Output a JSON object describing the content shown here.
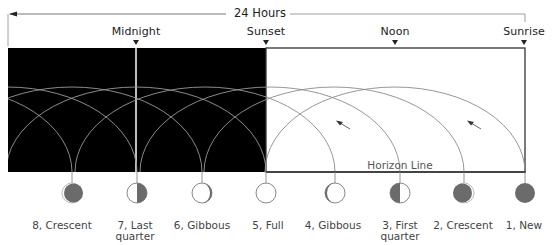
{
  "header": {
    "span_label": "24 Hours"
  },
  "time_markers": [
    {
      "label": "Midnight",
      "x": 136
    },
    {
      "label": "Sunset",
      "x": 266
    },
    {
      "label": "Noon",
      "x": 395
    },
    {
      "label": "Sunrise",
      "x": 524
    }
  ],
  "horizon": {
    "label": "Horizon Line"
  },
  "phases": [
    {
      "number": "8",
      "line1": "8, Crescent",
      "line2": "",
      "x": 72,
      "shape": "waning-crescent"
    },
    {
      "number": "7",
      "line1": "7, Last",
      "line2": "quarter",
      "x": 137,
      "shape": "last-quarter"
    },
    {
      "number": "6",
      "line1": "6, Gibbous",
      "line2": "",
      "x": 202,
      "shape": "waning-gibbous"
    },
    {
      "number": "5",
      "line1": "5, Full",
      "line2": "",
      "x": 266,
      "shape": "full"
    },
    {
      "number": "4",
      "line1": "4, Gibbous",
      "line2": "",
      "x": 335,
      "shape": "waxing-gibbous"
    },
    {
      "number": "3",
      "line1": "3, First",
      "line2": "quarter",
      "x": 400,
      "shape": "first-quarter"
    },
    {
      "number": "2",
      "line1": "2, Crescent",
      "line2": "",
      "x": 464,
      "shape": "waxing-crescent"
    },
    {
      "number": "1",
      "line1": "1, New",
      "line2": "",
      "x": 525,
      "shape": "new"
    }
  ],
  "colors": {
    "night": "#000000",
    "day": "#ffffff",
    "moon_dark": "#6b6b6b",
    "arc_on_dark": "#9a9a9a",
    "arc_on_light": "#8a8a8a",
    "frame": "#333333"
  }
}
